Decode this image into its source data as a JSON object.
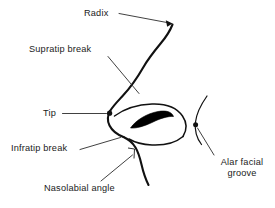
{
  "figure": {
    "kind": "anatomical-line-diagram",
    "background_color": "#ffffff",
    "line_color": "#111111",
    "text_color": "#1a1a1a"
  },
  "labels": {
    "radix": "Radix",
    "supratip_break": "Supratip break",
    "tip": "Tip",
    "infratip_break": "Infratip break",
    "nasolabial_angle": "Nasolabial angle",
    "alar_facial_groove_line1": "Alar facial",
    "alar_facial_groove_line2": "groove"
  },
  "annotations": [
    {
      "id": "radix",
      "label": "Radix",
      "leader": "straight line from label to arrowhead at nasal root",
      "pointer_style": "arrow"
    },
    {
      "id": "supratip-break",
      "label": "Supratip break",
      "leader": "diagonal line down-right toward nasal dorsum above tip",
      "pointer_style": "plain"
    },
    {
      "id": "tip",
      "label": "Tip",
      "leader": "horizontal line to dot marker on nasal tip",
      "pointer_style": "dot"
    },
    {
      "id": "infratip-break",
      "label": "Infratip break",
      "leader": "line rising to the right toward the columella",
      "pointer_style": "plain"
    },
    {
      "id": "nasolabial-angle",
      "label": "Nasolabial angle",
      "leader": "diagonal line up-right to the columella-lip junction",
      "pointer_style": "plain"
    },
    {
      "id": "alar-facial-groove",
      "label": "Alar facial groove",
      "leader": "diagonal line up-left to dot marker on the alar-facial arc",
      "pointer_style": "dot"
    }
  ]
}
